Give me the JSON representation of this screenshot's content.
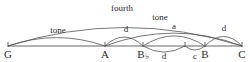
{
  "diagram": {
    "type": "musical-interval-arc-diagram",
    "line_color": "#555555",
    "text_color": "#2b2b2b",
    "baseline": {
      "y": 46,
      "x_start": 8,
      "x_end": 242
    },
    "notes": [
      {
        "id": "G",
        "label": "G",
        "x": 8,
        "tick": true
      },
      {
        "id": "A",
        "label": "A",
        "x": 105,
        "tick": true
      },
      {
        "id": "Bb",
        "label": "B",
        "accidental": "♭",
        "x": 143,
        "tick": true
      },
      {
        "id": "mid",
        "label": "",
        "x": 185,
        "tick": true
      },
      {
        "id": "B",
        "label": "B",
        "x": 205,
        "tick": true
      },
      {
        "id": "C",
        "label": "C",
        "x": 242,
        "tick": true
      }
    ],
    "arcs_above": [
      {
        "id": "fourth",
        "label": "fourth",
        "from_x": 8,
        "to_x": 242,
        "apex_y": 13,
        "label_x": 122,
        "label_y": 4
      },
      {
        "id": "tone-right",
        "label": "tone",
        "from_x": 105,
        "to_x": 242,
        "apex_y": 23,
        "label_x": 160,
        "label_y": 13
      },
      {
        "id": "tone-left",
        "label": "tone",
        "from_x": 8,
        "to_x": 105,
        "apex_y": 31,
        "label_x": 58,
        "label_y": 26
      },
      {
        "id": "d-A-Bb",
        "label": "d",
        "from_x": 105,
        "to_x": 143,
        "apex_y": 30,
        "label_x": 126,
        "label_y": 25
      },
      {
        "id": "a-Bb-B",
        "label": "a",
        "from_x": 143,
        "to_x": 205,
        "apex_y": 28,
        "label_x": 174,
        "label_y": 22
      },
      {
        "id": "d-B-C",
        "label": "d",
        "from_x": 205,
        "to_x": 242,
        "apex_y": 29,
        "label_x": 224,
        "label_y": 24
      }
    ],
    "arcs_below": [
      {
        "id": "d-below",
        "label": "d",
        "from_x": 143,
        "to_x": 185,
        "apex_y": 55,
        "label_x": 164,
        "label_y": 52
      },
      {
        "id": "c-below",
        "label": "c",
        "from_x": 185,
        "to_x": 205,
        "apex_y": 52,
        "label_x": 195,
        "label_y": 52
      }
    ]
  }
}
